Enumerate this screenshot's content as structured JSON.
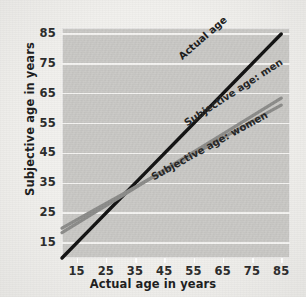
{
  "chart_data": {
    "type": "line",
    "title": "",
    "xlabel": "Actual age in years",
    "ylabel": "Subjective age in years",
    "xlim": [
      10,
      88
    ],
    "ylim": [
      10,
      87
    ],
    "xticks": [
      15,
      25,
      35,
      45,
      55,
      65,
      75,
      85
    ],
    "yticks": [
      15,
      25,
      35,
      45,
      55,
      65,
      75,
      85
    ],
    "grid": true,
    "legend_position": "inline-labels",
    "x": [
      10,
      20,
      30,
      40,
      50,
      60,
      70,
      80,
      85
    ],
    "series": [
      {
        "name": "Actual age",
        "color": "#111111",
        "values": [
          10,
          20,
          30,
          40,
          50,
          60,
          70,
          80,
          85
        ]
      },
      {
        "name": "Subjective age: men",
        "color": "#8b8b89",
        "values": [
          18.5,
          24.5,
          30.5,
          36.5,
          42.5,
          48.5,
          54.5,
          60.5,
          63.5
        ]
      },
      {
        "name": "Subjective age: women",
        "color": "#8b8b89",
        "values": [
          20,
          25.5,
          31,
          36.5,
          42,
          47.5,
          53,
          58.5,
          61.2
        ]
      }
    ],
    "annotations": [
      "Actual age",
      "Subjective age: men",
      "Subjective age: women"
    ]
  },
  "axes": {
    "x_title": "Actual age in years",
    "y_title": "Subjective age in years",
    "x_ticks": [
      "15",
      "25",
      "35",
      "45",
      "55",
      "65",
      "75",
      "85"
    ],
    "y_ticks": [
      "85",
      "75",
      "65",
      "55",
      "45",
      "35",
      "25",
      "15"
    ]
  },
  "labels": {
    "actual_age": "Actual age",
    "subjective_men": "Subjective age: men",
    "subjective_women": "Subjective age: women"
  },
  "colors": {
    "line_actual": "#111111",
    "line_subjective": "#8b8b89",
    "plot_background": "#c9c8c5",
    "figure_background": "#f2f1ee",
    "gridline": "#f4f3f1",
    "text": "#1c1c1c"
  }
}
